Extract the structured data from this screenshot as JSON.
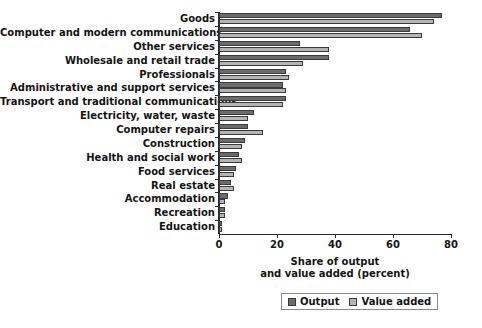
{
  "chart_data": {
    "type": "bar",
    "orientation": "horizontal",
    "title": "",
    "xlabel": "Share of output\nand value added (percent)",
    "ylabel": "",
    "xlim": [
      0,
      80
    ],
    "xticks": [
      0,
      20,
      40,
      60,
      80
    ],
    "grid": false,
    "legend_position": "bottom",
    "categories": [
      "Goods",
      "Computer and modern communications",
      "Other services",
      "Wholesale and retail trade",
      "Professionals",
      "Administrative and support services",
      "Transport and traditional communications",
      "Electricity, water, waste",
      "Computer repairs",
      "Construction",
      "Health and social work",
      "Food services",
      "Real estate",
      "Accommodation",
      "Recreation",
      "Education"
    ],
    "series": [
      {
        "name": "Output",
        "color": "#6b6b6b",
        "values": [
          77,
          66,
          28,
          38,
          23,
          22,
          23,
          12,
          10,
          9,
          7,
          6,
          4,
          3,
          2,
          1
        ]
      },
      {
        "name": "Value added",
        "color": "#b4b4b4",
        "values": [
          74,
          70,
          38,
          29,
          24,
          23,
          22,
          10,
          15,
          8,
          8,
          5,
          5,
          2,
          2,
          1
        ]
      }
    ]
  },
  "axis": {
    "title_line1": "Share of output",
    "title_line2": "and value added (percent)",
    "tick_labels": [
      "0",
      "20",
      "40",
      "60",
      "80"
    ]
  },
  "legend": {
    "items": [
      {
        "label": "Output"
      },
      {
        "label": "Value added"
      }
    ]
  },
  "colors": {
    "output": "#6b6b6b",
    "value_added": "#b4b4b4",
    "axis": "#2b2b2b",
    "background": "#ffffff"
  }
}
